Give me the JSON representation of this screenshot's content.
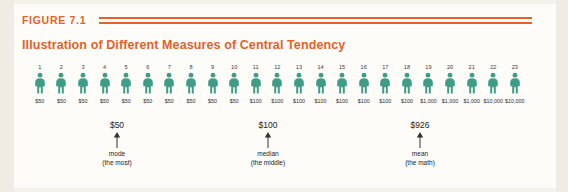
{
  "figure": {
    "label": "FIGURE 7.1",
    "title": "Illustration of Different Measures of Central Tendency",
    "accent_color": "#e2622a",
    "person_color": "#3f9c86",
    "background_color": "#fdfcf8"
  },
  "chart_data": {
    "type": "bar",
    "title": "Illustration of Different Measures of Central Tendency",
    "xlabel": "",
    "ylabel": "",
    "categories": [
      "1",
      "2",
      "3",
      "4",
      "5",
      "6",
      "7",
      "8",
      "9",
      "10",
      "11",
      "12",
      "13",
      "14",
      "15",
      "16",
      "17",
      "18",
      "19",
      "20",
      "21",
      "22",
      "23"
    ],
    "values": [
      50,
      50,
      50,
      50,
      50,
      50,
      50,
      50,
      50,
      50,
      100,
      100,
      100,
      100,
      100,
      100,
      100,
      100,
      1000,
      1000,
      1000,
      10000,
      10000
    ],
    "value_labels": [
      "$50",
      "$50",
      "$50",
      "$50",
      "$50",
      "$50",
      "$50",
      "$50",
      "$50",
      "$50",
      "$100",
      "$100",
      "$100",
      "$100",
      "$100",
      "$100",
      "$100",
      "$100",
      "$1,000",
      "$1,000",
      "$1,000",
      "$10,000",
      "$10,000"
    ],
    "series": [
      {
        "name": "Income per person",
        "values": [
          50,
          50,
          50,
          50,
          50,
          50,
          50,
          50,
          50,
          50,
          100,
          100,
          100,
          100,
          100,
          100,
          100,
          100,
          1000,
          1000,
          1000,
          10000,
          10000
        ]
      }
    ],
    "annotations": [
      {
        "name": "mode",
        "value": "$50",
        "sub": "(the most)",
        "points_to_index": 5
      },
      {
        "name": "median",
        "value": "$100",
        "sub": "(the middle)",
        "points_to_index": 12
      },
      {
        "name": "mean",
        "value": "$926",
        "sub": "(the math)",
        "points_to_index": 19
      }
    ],
    "grid": false,
    "legend": "none"
  },
  "people": [
    {
      "index": "1",
      "value": "$50"
    },
    {
      "index": "2",
      "value": "$50"
    },
    {
      "index": "3",
      "value": "$50"
    },
    {
      "index": "4",
      "value": "$50"
    },
    {
      "index": "5",
      "value": "$50"
    },
    {
      "index": "6",
      "value": "$50"
    },
    {
      "index": "7",
      "value": "$50"
    },
    {
      "index": "8",
      "value": "$50"
    },
    {
      "index": "9",
      "value": "$50"
    },
    {
      "index": "10",
      "value": "$50"
    },
    {
      "index": "11",
      "value": "$100"
    },
    {
      "index": "12",
      "value": "$100"
    },
    {
      "index": "13",
      "value": "$100"
    },
    {
      "index": "14",
      "value": "$100"
    },
    {
      "index": "15",
      "value": "$100"
    },
    {
      "index": "16",
      "value": "$100"
    },
    {
      "index": "17",
      "value": "$100"
    },
    {
      "index": "18",
      "value": "$100"
    },
    {
      "index": "19",
      "value": "$1,000"
    },
    {
      "index": "20",
      "value": "$1,000"
    },
    {
      "index": "21",
      "value": "$1,000"
    },
    {
      "index": "22",
      "value": "$10,000"
    },
    {
      "index": "23",
      "value": "$10,000"
    }
  ],
  "annotations": {
    "mode": {
      "value": "$50",
      "name": "mode",
      "sub": "(the most)"
    },
    "median": {
      "value": "$100",
      "name": "median",
      "sub": "(the middle)"
    },
    "mean": {
      "value": "$926",
      "name": "mean",
      "sub": "(the math)"
    }
  }
}
